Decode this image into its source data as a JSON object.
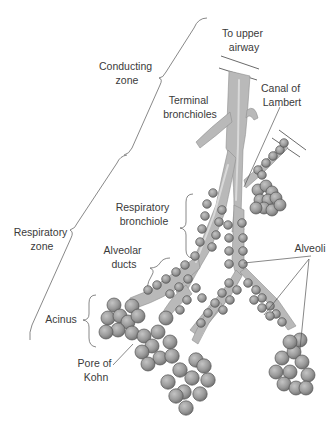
{
  "diagram": {
    "labels": {
      "to_upper_airway": [
        "To upper",
        "airway"
      ],
      "conducting_zone": [
        "Conducting",
        "zone"
      ],
      "terminal_bronchioles": [
        "Terminal",
        "bronchioles"
      ],
      "canal_of_lambert": [
        "Canal of",
        "Lambert"
      ],
      "respiratory_zone": [
        "Respiratory",
        "zone"
      ],
      "respiratory_bronchiole": [
        "Respiratory",
        "bronchiole"
      ],
      "alveolar_ducts": [
        "Alveolar",
        "ducts"
      ],
      "alveoli": [
        "Alveoli"
      ],
      "acinus": [
        "Acinus"
      ],
      "pore_of_kohn": [
        "Pore of",
        "Kohn"
      ]
    },
    "colors": {
      "airway_fill": "#b9b9b9",
      "alveolus_fill": "#9a9a9a",
      "text": "#3a3a3a",
      "line": "#555555"
    }
  }
}
